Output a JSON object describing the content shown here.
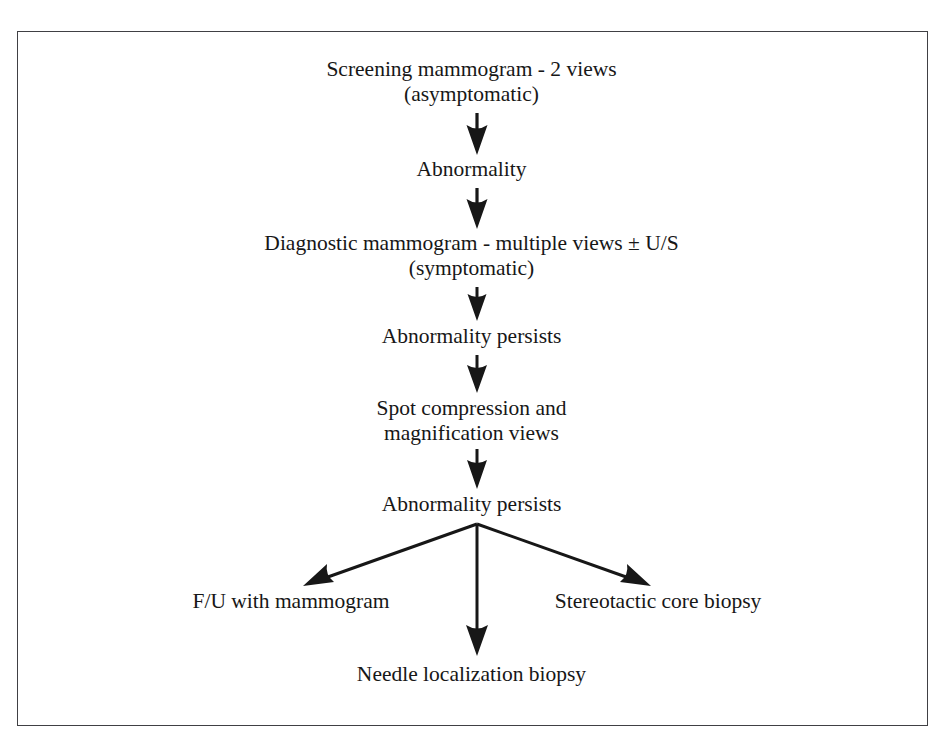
{
  "figure": {
    "type": "flowchart",
    "orientation": "top-to-bottom",
    "frame": {
      "border_color": "#404044",
      "background": "#ffffff"
    },
    "text_color": "#171717"
  },
  "nodes": {
    "screening": {
      "line1": "Screening mammogram - 2 views",
      "line2": "(asymptomatic)"
    },
    "abnormality": {
      "line1": "Abnormality"
    },
    "diagnostic": {
      "line1": "Diagnostic mammogram - multiple views ± U/S",
      "line2": "(symptomatic)"
    },
    "persists_1": {
      "line1": "Abnormality persists"
    },
    "spot_compression": {
      "line1": "Spot compression and",
      "line2": "magnification views"
    },
    "persists_2": {
      "line1": "Abnormality persists"
    },
    "followup": {
      "line1": "F/U with mammogram"
    },
    "needle_localization": {
      "line1": "Needle localization biopsy"
    },
    "stereotactic": {
      "line1": "Stereotactic core biopsy"
    }
  },
  "arrows": [
    {
      "name": "arrow-screening-to-abnormality",
      "direction": "down"
    },
    {
      "name": "arrow-abnormality-to-diagnostic",
      "direction": "down"
    },
    {
      "name": "arrow-diagnostic-to-persists1",
      "direction": "down"
    },
    {
      "name": "arrow-persists1-to-spot",
      "direction": "down"
    },
    {
      "name": "arrow-spot-to-persists2",
      "direction": "down"
    },
    {
      "name": "arrow-persists2-to-followup",
      "direction": "down-left"
    },
    {
      "name": "arrow-persists2-to-needle",
      "direction": "down"
    },
    {
      "name": "arrow-persists2-to-stereotactic",
      "direction": "down-right"
    }
  ]
}
